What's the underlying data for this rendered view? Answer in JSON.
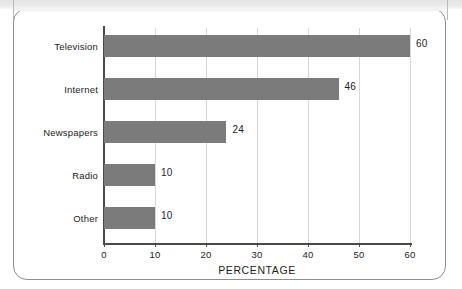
{
  "chart_data": {
    "type": "bar",
    "orientation": "horizontal",
    "title": "",
    "xlabel": "PERCENTAGE",
    "ylabel": "",
    "categories": [
      "Television",
      "Internet",
      "Newspapers",
      "Radio",
      "Other"
    ],
    "values": [
      60,
      46,
      24,
      10,
      10
    ],
    "value_labels": [
      "60",
      "46",
      "24",
      "10",
      "10"
    ],
    "xlim": [
      0,
      60
    ],
    "xticks": [
      0,
      10,
      20,
      30,
      40,
      50,
      60
    ],
    "xtick_labels": [
      "0",
      "10",
      "20",
      "30",
      "40",
      "50",
      "60"
    ],
    "grid": "vertical",
    "legend": "none",
    "bar_color": "#7b7b7b",
    "axis_color": "#4a4a4a",
    "gridline_color": "#d6d6d6",
    "text_color": "#1d1d1d",
    "frame_color": "#8e8e8e",
    "background": "#ffffff"
  }
}
